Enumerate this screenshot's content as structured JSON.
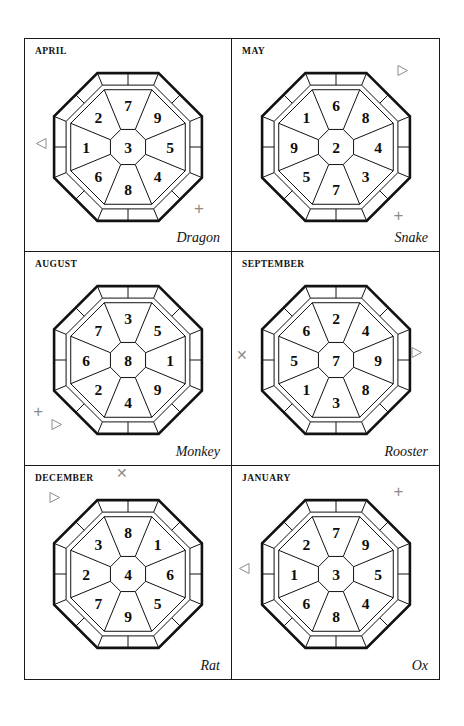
{
  "page": {
    "background": "#ffffff",
    "border_color": "#1a1a1a",
    "marker_color": "#8c8c8c"
  },
  "cells": [
    {
      "month": "APRIL",
      "zodiac": "Dragon",
      "center": "3",
      "wedges": [
        "7",
        "9",
        "5",
        "4",
        "8",
        "6",
        "1",
        "2"
      ],
      "markers": [
        {
          "kind": "triangle-left",
          "x": 5,
          "y": 46
        },
        {
          "kind": "plus",
          "x": 82,
          "y": 76
        }
      ]
    },
    {
      "month": "MAY",
      "zodiac": "Snake",
      "center": "2",
      "wedges": [
        "6",
        "8",
        "4",
        "3",
        "7",
        "5",
        "9",
        "1"
      ],
      "markers": [
        {
          "kind": "triangle-right",
          "x": 79,
          "y": 12
        },
        {
          "kind": "plus",
          "x": 78,
          "y": 79
        }
      ]
    },
    {
      "month": "AUGUST",
      "zodiac": "Monkey",
      "center": "8",
      "wedges": [
        "3",
        "5",
        "1",
        "9",
        "4",
        "2",
        "6",
        "7"
      ],
      "markers": [
        {
          "kind": "plus",
          "x": 4,
          "y": 71
        },
        {
          "kind": "triangle-right",
          "x": 12,
          "y": 78
        }
      ]
    },
    {
      "month": "SEPTEMBER",
      "zodiac": "Rooster",
      "center": "7",
      "wedges": [
        "2",
        "4",
        "9",
        "8",
        "3",
        "1",
        "5",
        "6"
      ],
      "markers": [
        {
          "kind": "cross",
          "x": 2,
          "y": 45
        },
        {
          "kind": "triangle-right",
          "x": 86,
          "y": 44
        }
      ]
    },
    {
      "month": "DECEMBER",
      "zodiac": "Rat",
      "center": "4",
      "wedges": [
        "8",
        "1",
        "6",
        "5",
        "9",
        "7",
        "2",
        "3"
      ],
      "markers": [
        {
          "kind": "cross",
          "x": 44,
          "y": 0
        },
        {
          "kind": "triangle-right",
          "x": 11,
          "y": 12
        }
      ]
    },
    {
      "month": "JANUARY",
      "zodiac": "Ox",
      "center": "3",
      "wedges": [
        "7",
        "9",
        "5",
        "4",
        "8",
        "6",
        "1",
        "2"
      ],
      "markers": [
        {
          "kind": "plus",
          "x": 78,
          "y": 8
        },
        {
          "kind": "triangle-left",
          "x": 3,
          "y": 45
        }
      ]
    }
  ]
}
